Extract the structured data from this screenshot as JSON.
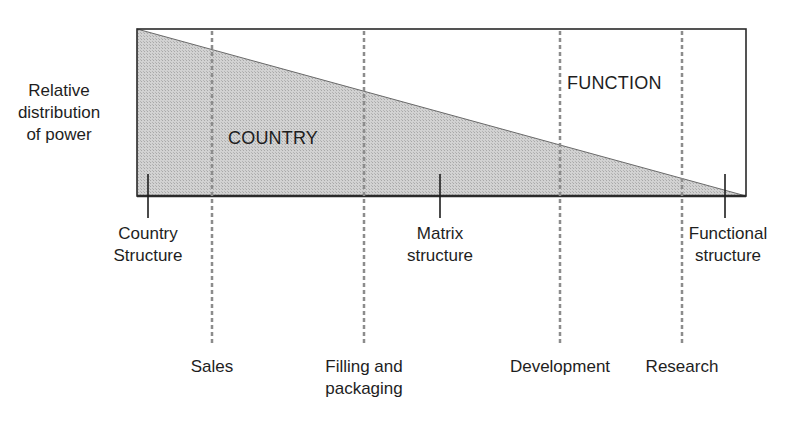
{
  "diagram": {
    "y_axis_label": [
      "Relative",
      "distribution",
      "of power"
    ],
    "regions": {
      "lower": "COUNTRY",
      "upper": "FUNCTION"
    },
    "structures": [
      {
        "line1": "Country",
        "line2": "Structure",
        "x": 148
      },
      {
        "line1": "Matrix",
        "line2": "structure",
        "x": 440
      },
      {
        "line1": "Functional",
        "line2": "structure",
        "x": 725
      }
    ],
    "functions": [
      {
        "line1": "Sales",
        "line2": "",
        "x": 212
      },
      {
        "line1": "Filling and",
        "line2": "packaging",
        "x": 364
      },
      {
        "line1": "Development",
        "line2": "",
        "x": 560
      },
      {
        "line1": "Research",
        "line2": "",
        "x": 682
      }
    ],
    "colors": {
      "shade": "#c8c8c8",
      "outline": "#2a2a2a",
      "dashed": "#8c8c8c"
    }
  }
}
